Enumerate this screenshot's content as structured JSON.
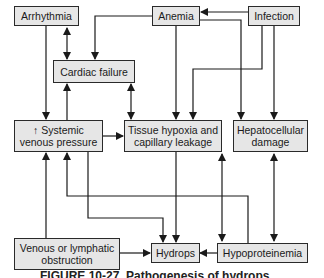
{
  "diagram": {
    "nodes": {
      "arrhythmia": "Arrhythmia",
      "anemia": "Anemia",
      "infection": "Infection",
      "cardiac_failure": "Cardiac failure",
      "systemic_venous_pressure": "↑ Systemic venous pressure",
      "tissue_hypoxia": "Tissue hypoxia and capillary leakage",
      "hepatocellular_damage": "Hepatocellular damage",
      "venous_lymphatic_obstruction": "Venous or lymphatic obstruction",
      "hydrops": "Hydrops",
      "hypoproteinemia": "Hypoproteinemia"
    },
    "edges": [
      {
        "from": "Infection",
        "to": "Anemia"
      },
      {
        "from": "Anemia",
        "to": "Cardiac failure"
      },
      {
        "from": "Anemia",
        "to": "Tissue hypoxia and capillary leakage"
      },
      {
        "from": "Anemia",
        "to": "Hepatocellular damage"
      },
      {
        "from": "Infection",
        "to": "Tissue hypoxia and capillary leakage"
      },
      {
        "from": "Infection",
        "to": "Hepatocellular damage"
      },
      {
        "from": "Arrhythmia",
        "to": "Cardiac failure",
        "bidirectional": true
      },
      {
        "from": "Arrhythmia",
        "to": "↑ Systemic venous pressure"
      },
      {
        "from": "↑ Systemic venous pressure",
        "to": "Cardiac failure"
      },
      {
        "from": "Cardiac failure",
        "to": "Tissue hypoxia and capillary leakage",
        "bidirectional": true
      },
      {
        "from": "↑ Systemic venous pressure",
        "to": "Tissue hypoxia and capillary leakage"
      },
      {
        "from": "↑ Systemic venous pressure",
        "to": "Hydrops"
      },
      {
        "from": "Tissue hypoxia and capillary leakage",
        "to": "Hydrops"
      },
      {
        "from": "Hypoproteinemia",
        "to": "↑ Systemic venous pressure"
      },
      {
        "from": "Tissue hypoxia and capillary leakage",
        "to": "Hypoproteinemia",
        "bidirectional": true
      },
      {
        "from": "Hepatocellular damage",
        "to": "Hypoproteinemia",
        "bidirectional": true
      },
      {
        "from": "Venous or lymphatic obstruction",
        "to": "↑ Systemic venous pressure"
      },
      {
        "from": "Venous or lymphatic obstruction",
        "to": "Hydrops"
      },
      {
        "from": "Hypoproteinemia",
        "to": "Hydrops"
      }
    ],
    "caption": "FIGURE 10-27. Pathogenesis of hydrops"
  }
}
